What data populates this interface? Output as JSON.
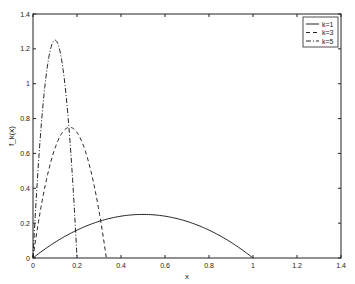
{
  "chart_data": {
    "type": "line",
    "title": "",
    "xlabel": "x",
    "ylabel": "f_k(x)",
    "xlim": [
      0,
      1.4
    ],
    "ylim": [
      0,
      1.4
    ],
    "grid": false,
    "legend_position": "upper right",
    "x_ticks": [
      "0",
      "0.2",
      "0.4",
      "0.6",
      "0.8",
      "1",
      "1.2",
      "1.4"
    ],
    "y_ticks": [
      "0",
      "0.2",
      "0.4",
      "0.6",
      "0.8",
      "1",
      "1.2",
      "1.4"
    ],
    "series": [
      {
        "name": "k=1",
        "style": "solid",
        "k": 1,
        "formula": "k^2 x (1 - k x)",
        "peak": [
          0.5,
          0.25
        ],
        "domain": [
          0,
          1
        ]
      },
      {
        "name": "k=3",
        "style": "dashed",
        "k": 3,
        "formula": "k^2 x (1 - k x)",
        "peak": [
          0.1667,
          0.75
        ],
        "domain": [
          0,
          0.3333
        ]
      },
      {
        "name": "k=5",
        "style": "dashdot",
        "k": 5,
        "formula": "k^2 x (1 - k x)",
        "peak": [
          0.1,
          1.25
        ],
        "domain": [
          0,
          0.2
        ]
      }
    ]
  }
}
